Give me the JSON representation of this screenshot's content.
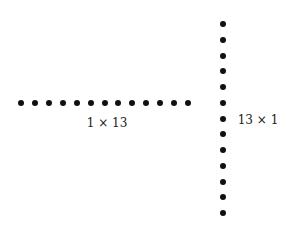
{
  "diagram": {
    "dot_color": "#111111",
    "background": "#ffffff",
    "row_array": {
      "label": "1 × 13",
      "rows": 1,
      "columns": 13,
      "x_start": 21,
      "x_end": 188,
      "y": 103,
      "label_pos": {
        "x": 107,
        "y": 123
      }
    },
    "column_array": {
      "label": "13 × 1",
      "rows": 13,
      "columns": 1,
      "x": 223,
      "y_start": 24,
      "y_end": 213,
      "label_pos": {
        "x": 258,
        "y": 120
      }
    }
  }
}
